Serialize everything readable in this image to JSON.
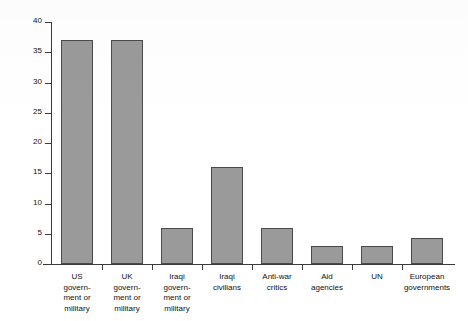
{
  "chart_data": {
    "type": "bar",
    "title": "",
    "subtitle": "",
    "xlabel": "",
    "ylabel": "% of coverage citing this source",
    "ylim": [
      0,
      40
    ],
    "ytick_step": 5,
    "yticks": [
      0,
      5,
      10,
      15,
      20,
      25,
      30,
      35,
      40
    ],
    "ytick_labels": [
      "0",
      "5",
      "10",
      "15",
      "20",
      "25",
      "30",
      "35",
      "40"
    ],
    "grid": false,
    "legend": false,
    "legend_position": "none",
    "bar_color": "#9a9a9a",
    "bar_edge_color": "#4a4a4a",
    "axis_color": "#3a3a3a",
    "categories": [
      "US government or military",
      "UK government or military",
      "Iraqi government or military",
      "Iraqi civilians",
      "Anti-war critics",
      "Aid agencies",
      "UN",
      "European governments"
    ],
    "category_label_lines": [
      [
        "US",
        "govern-",
        "ment or",
        "military"
      ],
      [
        "UK",
        "govern-",
        "ment or",
        "military"
      ],
      [
        "Iraqi",
        "govern-",
        "ment or",
        "military"
      ],
      [
        "Iraqi",
        "civilians"
      ],
      [
        "Anti-war",
        "critics"
      ],
      [
        "Aid",
        "agencies"
      ],
      [
        "UN"
      ],
      [
        "European",
        "governments"
      ]
    ],
    "values": [
      37,
      37,
      6,
      16,
      6,
      3,
      3,
      4.3
    ]
  }
}
